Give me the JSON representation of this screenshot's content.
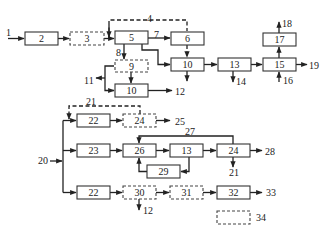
{
  "diagram": {
    "type": "process-flow-block-diagram",
    "boxes": [
      {
        "id": "b2",
        "label": "2",
        "x": 25,
        "y": 32,
        "w": 33,
        "h": 13,
        "style": "solid"
      },
      {
        "id": "b3",
        "label": "3",
        "x": 70,
        "y": 32,
        "w": 34,
        "h": 13,
        "style": "dashed"
      },
      {
        "id": "b5",
        "label": "5",
        "x": 115,
        "y": 31,
        "w": 33,
        "h": 13,
        "style": "solid"
      },
      {
        "id": "b6",
        "label": "6",
        "x": 171,
        "y": 32,
        "w": 33,
        "h": 13,
        "style": "solid"
      },
      {
        "id": "b9",
        "label": "9",
        "x": 115,
        "y": 60,
        "w": 33,
        "h": 12,
        "style": "dashed"
      },
      {
        "id": "b10a",
        "label": "10",
        "x": 171,
        "y": 58,
        "w": 33,
        "h": 13,
        "style": "solid"
      },
      {
        "id": "b10b",
        "label": "10",
        "x": 115,
        "y": 84,
        "w": 33,
        "h": 13,
        "style": "solid"
      },
      {
        "id": "b13a",
        "label": "13",
        "x": 218,
        "y": 58,
        "w": 33,
        "h": 13,
        "style": "solid"
      },
      {
        "id": "b15",
        "label": "15",
        "x": 263,
        "y": 58,
        "w": 33,
        "h": 13,
        "style": "solid"
      },
      {
        "id": "b17",
        "label": "17",
        "x": 263,
        "y": 33,
        "w": 33,
        "h": 13,
        "style": "solid"
      },
      {
        "id": "b22a",
        "label": "22",
        "x": 77,
        "y": 114,
        "w": 33,
        "h": 13,
        "style": "solid"
      },
      {
        "id": "b24a",
        "label": "24",
        "x": 123,
        "y": 114,
        "w": 33,
        "h": 13,
        "style": "dashed"
      },
      {
        "id": "b23",
        "label": "23",
        "x": 77,
        "y": 144,
        "w": 33,
        "h": 13,
        "style": "solid"
      },
      {
        "id": "b26",
        "label": "26",
        "x": 123,
        "y": 144,
        "w": 33,
        "h": 13,
        "style": "solid"
      },
      {
        "id": "b13b",
        "label": "13",
        "x": 170,
        "y": 144,
        "w": 33,
        "h": 13,
        "style": "solid"
      },
      {
        "id": "b24b",
        "label": "24",
        "x": 217,
        "y": 144,
        "w": 33,
        "h": 13,
        "style": "solid"
      },
      {
        "id": "b29",
        "label": "29",
        "x": 147,
        "y": 165,
        "w": 33,
        "h": 13,
        "style": "solid"
      },
      {
        "id": "b22b",
        "label": "22",
        "x": 77,
        "y": 186,
        "w": 33,
        "h": 13,
        "style": "solid"
      },
      {
        "id": "b30",
        "label": "30",
        "x": 123,
        "y": 186,
        "w": 33,
        "h": 13,
        "style": "dashed"
      },
      {
        "id": "b31",
        "label": "31",
        "x": 170,
        "y": 186,
        "w": 33,
        "h": 13,
        "style": "dashed"
      },
      {
        "id": "b32",
        "label": "32",
        "x": 217,
        "y": 186,
        "w": 33,
        "h": 13,
        "style": "solid"
      },
      {
        "id": "b34",
        "label": "",
        "x": 217,
        "y": 211,
        "w": 33,
        "h": 13,
        "style": "dashed"
      }
    ],
    "labels": [
      {
        "text": "1",
        "x": 6,
        "y": 36
      },
      {
        "text": "4",
        "x": 147,
        "y": 22
      },
      {
        "text": "7",
        "x": 154,
        "y": 38
      },
      {
        "text": "8",
        "x": 116,
        "y": 56
      },
      {
        "text": "11",
        "x": 84,
        "y": 84
      },
      {
        "text": "12",
        "x": 175,
        "y": 95
      },
      {
        "text": "14",
        "x": 236,
        "y": 85
      },
      {
        "text": "16",
        "x": 283,
        "y": 84
      },
      {
        "text": "18",
        "x": 282,
        "y": 27
      },
      {
        "text": "19",
        "x": 309,
        "y": 69
      },
      {
        "text": "21",
        "x": 86,
        "y": 105
      },
      {
        "text": "25",
        "x": 175,
        "y": 125
      },
      {
        "text": "27",
        "x": 185,
        "y": 135
      },
      {
        "text": "28",
        "x": 265,
        "y": 155
      },
      {
        "text": "21",
        "x": 229,
        "y": 176
      },
      {
        "text": "20",
        "x": 38,
        "y": 164
      },
      {
        "text": "12",
        "x": 143,
        "y": 214
      },
      {
        "text": "33",
        "x": 266,
        "y": 196
      },
      {
        "text": "34",
        "x": 256,
        "y": 221
      }
    ]
  }
}
